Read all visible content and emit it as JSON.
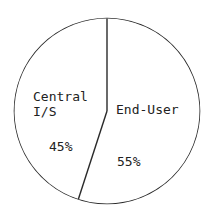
{
  "chart_data": {
    "type": "pie",
    "title": "",
    "start_angle_deg": 0,
    "direction": "clockwise",
    "slices": [
      {
        "label": "End-User",
        "label_lines": [
          "End-User"
        ],
        "value": 55,
        "value_label": "55%"
      },
      {
        "label": "Central I/S",
        "label_lines": [
          "Central",
          "I/S"
        ],
        "value": 45,
        "value_label": "45%"
      }
    ],
    "colors": {
      "stroke": "#2a2a2a",
      "fill": "#ffffff",
      "text": "#222222"
    }
  }
}
